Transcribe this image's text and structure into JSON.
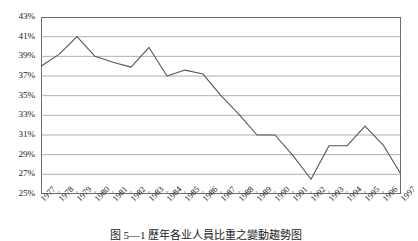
{
  "chart_data": {
    "type": "line",
    "title": "",
    "xlabel": "",
    "ylabel": "",
    "grid": true,
    "legend": false,
    "ylim": [
      25,
      43
    ],
    "ytick_step": 2,
    "ytick_labels": [
      "43%",
      "41%",
      "39%",
      "37%",
      "35%",
      "33%",
      "31%",
      "29%",
      "27%",
      "25%"
    ],
    "ytick_values": [
      43,
      41,
      39,
      37,
      35,
      33,
      31,
      29,
      27,
      25
    ],
    "categories": [
      "1977",
      "1978",
      "1979",
      "1980",
      "1981",
      "1982",
      "1983",
      "1984",
      "1985",
      "1986",
      "1987",
      "1988",
      "1989",
      "1990",
      "1991",
      "1992",
      "1993",
      "1994",
      "1995",
      "1996",
      "1997"
    ],
    "values": [
      38.0,
      39.2,
      41.0,
      39.0,
      38.4,
      37.9,
      39.9,
      37.0,
      37.6,
      37.2,
      35.0,
      33.1,
      31.0,
      31.0,
      28.9,
      26.5,
      29.9,
      29.9,
      31.9,
      30.0,
      27.0
    ],
    "series": [
      {
        "name": "series-1",
        "color": "#555555",
        "values": [
          38.0,
          39.2,
          41.0,
          39.0,
          38.4,
          37.9,
          39.9,
          37.0,
          37.6,
          37.2,
          35.0,
          33.1,
          31.0,
          31.0,
          28.9,
          26.5,
          29.9,
          29.9,
          31.9,
          30.0,
          27.0
        ]
      }
    ]
  },
  "caption": {
    "text": "图 5—1  歷年各业人員比重之變動趨勢图"
  },
  "style": {
    "line_color": "#555555",
    "grid_color": "#9a9a9a",
    "frame_color": "#6e6e6e",
    "background": "#ffffff"
  }
}
